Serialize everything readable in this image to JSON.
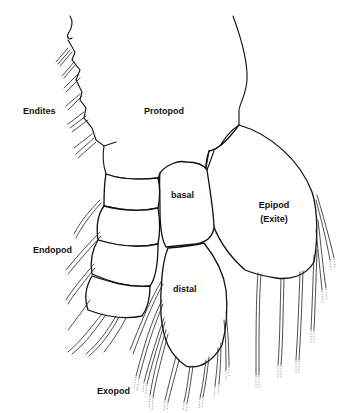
{
  "figure": {
    "line_color": "#111111",
    "background": "#ffffff"
  },
  "labels": {
    "endites": "Endites",
    "protopod": "Protopod",
    "basal": "basal",
    "epipod": "Epipod",
    "exite": "(Exite)",
    "endopod": "Endopod",
    "distal": "distal",
    "exopod": "Exopod"
  }
}
